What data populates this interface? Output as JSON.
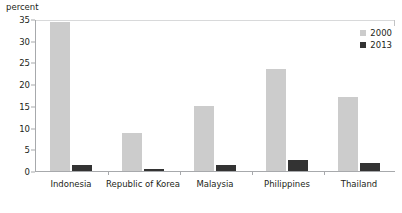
{
  "chart_data": {
    "type": "bar",
    "title": "",
    "subtitle": "",
    "xlabel": "",
    "ylabel": "percent",
    "ylim": [
      0,
      35
    ],
    "yticks": [
      "0",
      "5",
      "10",
      "15",
      "20",
      "25",
      "30",
      "35"
    ],
    "grid": false,
    "legend_position": "top-right",
    "categories": [
      "Indonesia",
      "Republic of Korea",
      "Malaysia",
      "Philippines",
      "Thailand"
    ],
    "series": [
      {
        "name": "2000",
        "color": "#cccccc",
        "values": [
          34.3,
          8.7,
          15.0,
          23.5,
          17.0
        ]
      },
      {
        "name": "2013",
        "color": "#333333",
        "values": [
          1.5,
          0.5,
          1.3,
          2.5,
          1.8
        ]
      }
    ]
  },
  "axis": {
    "unit_caption": "percent"
  }
}
